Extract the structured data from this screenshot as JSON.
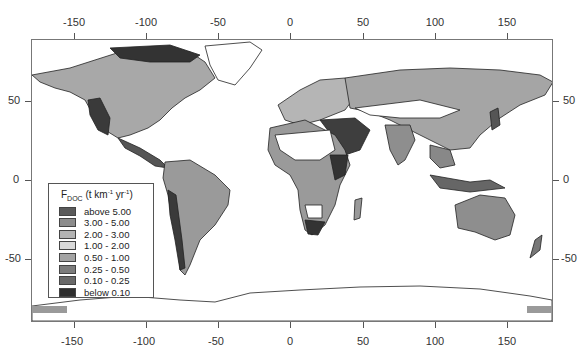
{
  "map": {
    "type": "choropleth",
    "projection": "equirectangular",
    "x_axis": {
      "top_ticks": [
        "-150",
        "-100",
        "-50",
        "0",
        "50",
        "100",
        "150"
      ],
      "bottom_ticks": [
        "-150",
        "-100",
        "-50",
        "0",
        "50",
        "100",
        "150"
      ],
      "range": [
        -180,
        180
      ]
    },
    "y_axis": {
      "left_ticks": [
        "50",
        "0",
        "-50"
      ],
      "right_ticks": [
        "50",
        "0",
        "-50"
      ],
      "range": [
        -90,
        90
      ]
    }
  },
  "legend": {
    "title_main": "F",
    "title_sub": "DOC",
    "title_unit_open": " (t km",
    "title_sup1": "-1",
    "title_unit_mid": " yr",
    "title_sup2": "-1",
    "title_unit_close": ")",
    "items": [
      {
        "label": "above 5.00",
        "color": "#5a5a5a"
      },
      {
        "label": "3.00 - 5.00",
        "color": "#8c8c8c"
      },
      {
        "label": "2.00 - 3.00",
        "color": "#b4b4b4"
      },
      {
        "label": "1.00 - 2.00",
        "color": "#d9d9d9"
      },
      {
        "label": "0.50 - 1.00",
        "color": "#a3a3a3"
      },
      {
        "label": "0.25 - 0.50",
        "color": "#7c7c7c"
      },
      {
        "label": "0.10 - 0.25",
        "color": "#696969"
      },
      {
        "label": "below 0.10",
        "color": "#2e2e2e"
      }
    ]
  }
}
